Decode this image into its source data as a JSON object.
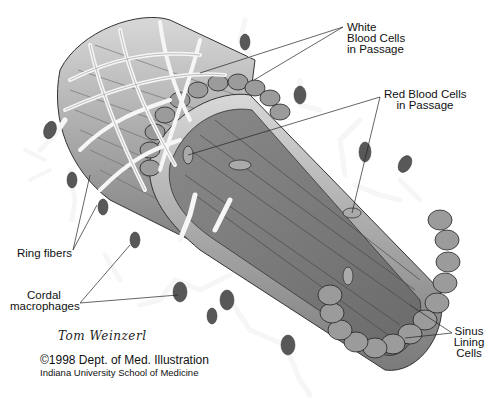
{
  "figure": {
    "style": "grayscale pencil illustration"
  },
  "labels": {
    "white_blood_cells": [
      "White",
      "Blood Cells",
      "in Passage"
    ],
    "red_blood_cells": [
      "Red Blood Cells",
      "in Passage"
    ],
    "ring_fibers": "Ring fibers",
    "cordal_macrophages": [
      "Cordal",
      "macrophages"
    ],
    "sinus_lining_cells": [
      "Sinus",
      "Lining",
      "Cells"
    ]
  },
  "credits": {
    "signature": "Tom Weinzerl",
    "copyright": "©1998 Dept. of Med. Illustration",
    "institution": "Indiana University School of Medicine"
  },
  "colors": {
    "background": "#ffffff",
    "tube_dark": "#6e6e6e",
    "tube_mid": "#9a9a9a",
    "tube_light": "#c8c8c8",
    "fiber": "#f4f4f4",
    "nucleus": "#5a5a5a",
    "line": "#222222"
  }
}
